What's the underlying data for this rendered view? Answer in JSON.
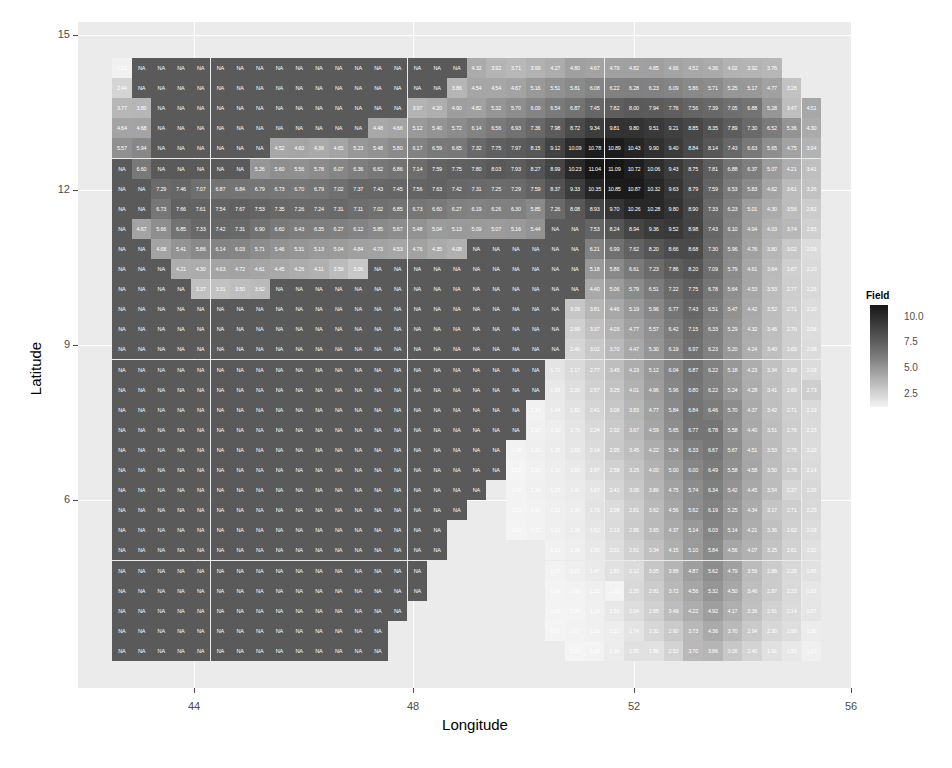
{
  "chart_data": {
    "type": "heatmap",
    "title": "",
    "xlabel": "Longitude",
    "ylabel": "Latitude",
    "x_ticks": [
      "44",
      "48",
      "52",
      "56"
    ],
    "y_ticks": [
      "15",
      "12",
      "9",
      "6"
    ],
    "xlim": [
      42.2,
      56.2
    ],
    "ylim": [
      3.6,
      15.4
    ],
    "legend": {
      "title": "Field",
      "ticks": [
        "10.0",
        "7.5",
        "5.0",
        "2.5"
      ],
      "range": [
        1.0,
        11.1
      ],
      "low_color": "#f4f4f4",
      "high_color": "#161616"
    },
    "na_color": "#5a5a5a",
    "n_cols": 36,
    "n_rows": 30,
    "rows": [
      [
        "1.12",
        "NA",
        "NA",
        "NA",
        "NA",
        "NA",
        "NA",
        "NA",
        "NA",
        "NA",
        "NA",
        "NA",
        "NA",
        "NA",
        "NA",
        "NA",
        "NA",
        "NA",
        "4.32",
        "3.92",
        "3.71",
        "3.99",
        "4.27",
        "4.80",
        "4.67",
        "4.79",
        "4.82",
        "4.85",
        "4.66",
        "4.52",
        "4.36",
        "4.02",
        "3.92",
        "3.76",
        "",
        ""
      ],
      [
        "2.44",
        "NA",
        "NA",
        "NA",
        "NA",
        "NA",
        "NA",
        "NA",
        "NA",
        "NA",
        "NA",
        "NA",
        "NA",
        "NA",
        "NA",
        "NA",
        "NA",
        "3.86",
        "4.54",
        "4.54",
        "4.67",
        "5.16",
        "5.51",
        "5.81",
        "6.08",
        "6.22",
        "6.28",
        "6.23",
        "6.09",
        "5.86",
        "5.71",
        "5.25",
        "5.17",
        "4.77",
        "3.28",
        ""
      ],
      [
        "3.77",
        "3.80",
        "NA",
        "NA",
        "NA",
        "NA",
        "NA",
        "NA",
        "NA",
        "NA",
        "NA",
        "NA",
        "NA",
        "NA",
        "NA",
        "3.97",
        "4.20",
        "4.90",
        "4.82",
        "5.32",
        "5.70",
        "6.09",
        "6.54",
        "6.87",
        "7.45",
        "7.82",
        "8.00",
        "7.94",
        "7.76",
        "7.56",
        "7.39",
        "7.05",
        "6.88",
        "5.28",
        "3.47",
        "4.51"
      ],
      [
        "4.64",
        "4.68",
        "NA",
        "NA",
        "NA",
        "NA",
        "NA",
        "NA",
        "NA",
        "NA",
        "NA",
        "NA",
        "NA",
        "4.48",
        "4.66",
        "5.12",
        "5.40",
        "5.72",
        "6.14",
        "6.56",
        "6.93",
        "7.36",
        "7.98",
        "8.72",
        "9.34",
        "9.81",
        "9.80",
        "9.51",
        "9.21",
        "8.85",
        "8.35",
        "7.89",
        "7.30",
        "6.52",
        "5.36",
        "4.30"
      ],
      [
        "5.57",
        "5.94",
        "NA",
        "NA",
        "NA",
        "NA",
        "NA",
        "NA",
        "4.52",
        "4.60",
        "4.36",
        "4.65",
        "5.23",
        "5.48",
        "5.80",
        "6.17",
        "6.59",
        "6.65",
        "7.32",
        "7.75",
        "7.97",
        "8.15",
        "9.12",
        "10.09",
        "10.78",
        "10.89",
        "10.43",
        "9.90",
        "9.40",
        "8.84",
        "8.14",
        "7.43",
        "6.63",
        "5.65",
        "4.75",
        "3.94"
      ],
      [
        "NA",
        "6.60",
        "NA",
        "NA",
        "NA",
        "NA",
        "NA",
        "5.26",
        "5.60",
        "5.56",
        "5.78",
        "6.07",
        "6.36",
        "6.62",
        "6.86",
        "7.14",
        "7.59",
        "7.75",
        "7.80",
        "8.03",
        "7.93",
        "8.27",
        "8.99",
        "10.23",
        "11.04",
        "11.09",
        "10.72",
        "10.06",
        "9.43",
        "8.75",
        "7.81",
        "6.88",
        "6.37",
        "5.07",
        "4.21",
        "3.41"
      ],
      [
        "NA",
        "NA",
        "7.29",
        "7.46",
        "7.07",
        "6.87",
        "6.84",
        "6.79",
        "6.73",
        "6.70",
        "6.79",
        "7.02",
        "7.37",
        "7.43",
        "7.45",
        "7.56",
        "7.63",
        "7.42",
        "7.31",
        "7.25",
        "7.29",
        "7.59",
        "8.37",
        "9.33",
        "10.35",
        "10.85",
        "10.87",
        "10.32",
        "9.63",
        "8.79",
        "7.59",
        "6.53",
        "5.83",
        "4.62",
        "3.61",
        "3.26"
      ],
      [
        "NA",
        "NA",
        "6.73",
        "7.66",
        "7.61",
        "7.54",
        "7.67",
        "7.53",
        "7.35",
        "7.26",
        "7.24",
        "7.31",
        "7.11",
        "7.02",
        "6.85",
        "6.73",
        "6.60",
        "6.27",
        "6.19",
        "6.26",
        "6.30",
        "5.85",
        "7.26",
        "8.08",
        "8.93",
        "9.70",
        "10.26",
        "10.28",
        "9.80",
        "8.90",
        "7.33",
        "6.23",
        "5.01",
        "4.30",
        "3.56",
        "2.82"
      ],
      [
        "NA",
        "4.67",
        "5.66",
        "6.85",
        "7.33",
        "7.42",
        "7.31",
        "6.90",
        "6.60",
        "6.43",
        "6.35",
        "6.27",
        "6.12",
        "5.85",
        "5.67",
        "5.48",
        "5.04",
        "5.13",
        "5.09",
        "5.07",
        "5.16",
        "5.44",
        "NA",
        "NA",
        "7.53",
        "8.24",
        "8.94",
        "9.36",
        "9.52",
        "8.98",
        "7.43",
        "6.10",
        "4.94",
        "4.03",
        "3.74",
        "2.65"
      ],
      [
        "NA",
        "NA",
        "4.68",
        "5.41",
        "5.86",
        "6.14",
        "6.03",
        "5.71",
        "5.46",
        "5.31",
        "5.13",
        "5.04",
        "4.84",
        "4.73",
        "4.53",
        "4.76",
        "4.35",
        "4.08",
        "NA",
        "NA",
        "NA",
        "NA",
        "NA",
        "NA",
        "6.21",
        "6.99",
        "7.62",
        "8.20",
        "8.66",
        "8.68",
        "7.30",
        "5.96",
        "4.76",
        "3.80",
        "3.02",
        "2.09"
      ],
      [
        "NA",
        "NA",
        "NA",
        "4.21",
        "4.30",
        "4.63",
        "4.72",
        "4.61",
        "4.45",
        "4.26",
        "4.11",
        "3.59",
        "3.06",
        "NA",
        "NA",
        "NA",
        "NA",
        "NA",
        "NA",
        "NA",
        "NA",
        "NA",
        "NA",
        "NA",
        "5.18",
        "5.86",
        "6.61",
        "7.23",
        "7.86",
        "8.20",
        "7.09",
        "5.79",
        "4.61",
        "3.64",
        "2.67",
        "2.20"
      ],
      [
        "NA",
        "NA",
        "NA",
        "NA",
        "3.37",
        "3.31",
        "3.50",
        "3.62",
        "NA",
        "NA",
        "NA",
        "NA",
        "NA",
        "NA",
        "NA",
        "NA",
        "NA",
        "NA",
        "NA",
        "NA",
        "NA",
        "NA",
        "NA",
        "NA",
        "4.40",
        "5.06",
        "5.79",
        "6.51",
        "7.22",
        "7.75",
        "6.78",
        "5.64",
        "4.53",
        "3.53",
        "2.77",
        "2.25"
      ],
      [
        "NA",
        "NA",
        "NA",
        "NA",
        "NA",
        "NA",
        "NA",
        "NA",
        "NA",
        "NA",
        "NA",
        "NA",
        "NA",
        "NA",
        "NA",
        "NA",
        "NA",
        "NA",
        "NA",
        "NA",
        "NA",
        "NA",
        "NA",
        "3.09",
        "3.81",
        "4.46",
        "5.19",
        "5.96",
        "6.77",
        "7.43",
        "6.51",
        "5.47",
        "4.42",
        "3.52",
        "2.71",
        "2.10"
      ],
      [
        "NA",
        "NA",
        "NA",
        "NA",
        "NA",
        "NA",
        "NA",
        "NA",
        "NA",
        "NA",
        "NA",
        "NA",
        "NA",
        "NA",
        "NA",
        "NA",
        "NA",
        "NA",
        "NA",
        "NA",
        "NA",
        "NA",
        "NA",
        "2.69",
        "3.37",
        "4.03",
        "4.77",
        "5.57",
        "6.42",
        "7.15",
        "6.33",
        "5.29",
        "4.32",
        "3.46",
        "2.70",
        "2.06"
      ],
      [
        "NA",
        "NA",
        "NA",
        "NA",
        "NA",
        "NA",
        "NA",
        "NA",
        "NA",
        "NA",
        "NA",
        "NA",
        "NA",
        "NA",
        "NA",
        "NA",
        "NA",
        "NA",
        "NA",
        "NA",
        "NA",
        "NA",
        "NA",
        "2.40",
        "3.02",
        "3.70",
        "4.47",
        "5.30",
        "6.19",
        "6.97",
        "6.23",
        "5.20",
        "4.24",
        "3.40",
        "2.69",
        "2.08"
      ],
      [
        "NA",
        "NA",
        "NA",
        "NA",
        "NA",
        "NA",
        "NA",
        "NA",
        "NA",
        "NA",
        "NA",
        "NA",
        "NA",
        "NA",
        "NA",
        "NA",
        "NA",
        "NA",
        "NA",
        "NA",
        "NA",
        "NA",
        "1.71",
        "2.17",
        "2.77",
        "3.45",
        "4.23",
        "5.12",
        "6.04",
        "6.87",
        "6.22",
        "5.18",
        "4.23",
        "3.34",
        "2.69",
        "2.09"
      ],
      [
        "NA",
        "NA",
        "NA",
        "NA",
        "NA",
        "NA",
        "NA",
        "NA",
        "NA",
        "NA",
        "NA",
        "NA",
        "NA",
        "NA",
        "NA",
        "NA",
        "NA",
        "NA",
        "NA",
        "NA",
        "NA",
        "NA",
        "1.56",
        "2.00",
        "2.57",
        "3.25",
        "4.01",
        "4.96",
        "5.96",
        "6.80",
        "6.22",
        "5.24",
        "4.28",
        "3.41",
        "2.69",
        "2.73"
      ],
      [
        "NA",
        "NA",
        "NA",
        "NA",
        "NA",
        "NA",
        "NA",
        "NA",
        "NA",
        "NA",
        "NA",
        "NA",
        "NA",
        "NA",
        "NA",
        "NA",
        "NA",
        "NA",
        "NA",
        "NA",
        "NA",
        "1.14",
        "1.44",
        "1.82",
        "2.41",
        "3.06",
        "3.83",
        "4.77",
        "5.84",
        "6.84",
        "6.46",
        "5.70",
        "4.37",
        "3.42",
        "2.71",
        "2.19"
      ],
      [
        "NA",
        "NA",
        "NA",
        "NA",
        "NA",
        "NA",
        "NA",
        "NA",
        "NA",
        "NA",
        "NA",
        "NA",
        "NA",
        "NA",
        "NA",
        "NA",
        "NA",
        "NA",
        "NA",
        "NA",
        "NA",
        "1.17",
        "1.32",
        "1.70",
        "2.24",
        "2.92",
        "3.67",
        "4.59",
        "5.65",
        "6.77",
        "6.78",
        "5.58",
        "4.40",
        "3.51",
        "2.76",
        "2.15"
      ],
      [
        "NA",
        "NA",
        "NA",
        "NA",
        "NA",
        "NA",
        "NA",
        "NA",
        "NA",
        "NA",
        "NA",
        "NA",
        "NA",
        "NA",
        "NA",
        "NA",
        "NA",
        "NA",
        "NA",
        "NA",
        "1.08",
        "1.21",
        "1.36",
        "1.63",
        "2.14",
        "2.95",
        "3.45",
        "4.22",
        "5.34",
        "6.33",
        "6.67",
        "5.67",
        "4.51",
        "3.53",
        "2.75",
        "2.10"
      ],
      [
        "NA",
        "NA",
        "NA",
        "NA",
        "NA",
        "NA",
        "NA",
        "NA",
        "NA",
        "NA",
        "NA",
        "NA",
        "NA",
        "NA",
        "NA",
        "NA",
        "NA",
        "NA",
        "NA",
        "NA",
        "1.01",
        "1.15",
        "1.30",
        "1.50",
        "1.97",
        "2.58",
        "3.25",
        "4.00",
        "5.00",
        "6.00",
        "6.49",
        "5.58",
        "4.58",
        "3.50",
        "2.78",
        "2.14"
      ],
      [
        "NA",
        "NA",
        "NA",
        "NA",
        "NA",
        "NA",
        "NA",
        "NA",
        "NA",
        "NA",
        "NA",
        "NA",
        "NA",
        "NA",
        "NA",
        "NA",
        "NA",
        "NA",
        "NA",
        "",
        "1.06",
        "1.16",
        "1.26",
        "1.41",
        "1.67",
        "2.42",
        "3.06",
        "3.86",
        "4.75",
        "5.74",
        "6.34",
        "5.42",
        "4.45",
        "3.54",
        "2.37",
        "2.26"
      ],
      [
        "NA",
        "NA",
        "NA",
        "NA",
        "NA",
        "NA",
        "NA",
        "NA",
        "NA",
        "NA",
        "NA",
        "NA",
        "NA",
        "NA",
        "NA",
        "NA",
        "NA",
        "NA",
        "",
        "",
        "1.03",
        "1.10",
        "1.21",
        "1.34",
        "1.76",
        "2.08",
        "2.81",
        "3.62",
        "4.56",
        "5.62",
        "6.19",
        "5.25",
        "4.34",
        "3.17",
        "2.71",
        "2.25"
      ],
      [
        "NA",
        "NA",
        "NA",
        "NA",
        "NA",
        "NA",
        "NA",
        "NA",
        "NA",
        "NA",
        "NA",
        "NA",
        "NA",
        "NA",
        "NA",
        "NA",
        "NA",
        "",
        "",
        "",
        "1.02",
        "1.11",
        "1.21",
        "1.36",
        "1.62",
        "2.13",
        "2.86",
        "3.65",
        "4.37",
        "5.14",
        "6.03",
        "5.14",
        "4.21",
        "3.36",
        "2.62",
        "2.09"
      ],
      [
        "NA",
        "NA",
        "NA",
        "NA",
        "NA",
        "NA",
        "NA",
        "NA",
        "NA",
        "NA",
        "NA",
        "NA",
        "NA",
        "NA",
        "NA",
        "NA",
        "NA",
        "",
        "",
        "",
        "",
        "",
        "1.13",
        "1.26",
        "1.56",
        "2.01",
        "2.61",
        "3.34",
        "4.15",
        "5.10",
        "5.84",
        "4.56",
        "4.07",
        "3.25",
        "2.61",
        "1.92"
      ],
      [
        "NA",
        "NA",
        "NA",
        "NA",
        "NA",
        "NA",
        "NA",
        "NA",
        "NA",
        "NA",
        "NA",
        "NA",
        "NA",
        "NA",
        "NA",
        "NA",
        "",
        "",
        "",
        "",
        "",
        "",
        "1.07",
        "1.21",
        "1.47",
        "1.85",
        "2.12",
        "3.05",
        "3.88",
        "4.87",
        "5.62",
        "4.79",
        "3.59",
        "2.88",
        "2.28",
        "1.86"
      ],
      [
        "NA",
        "NA",
        "NA",
        "NA",
        "NA",
        "NA",
        "NA",
        "NA",
        "NA",
        "NA",
        "NA",
        "NA",
        "NA",
        "NA",
        "NA",
        "NA",
        "",
        "",
        "",
        "",
        "",
        "",
        "1.04",
        "1.09",
        "1.21",
        "1.05",
        "2.25",
        "2.81",
        "3.72",
        "4.56",
        "5.32",
        "4.50",
        "3.46",
        "2.87",
        "2.23",
        "1.62"
      ],
      [
        "NA",
        "NA",
        "NA",
        "NA",
        "NA",
        "NA",
        "NA",
        "NA",
        "NA",
        "NA",
        "NA",
        "NA",
        "NA",
        "NA",
        "NA",
        "",
        "",
        "",
        "",
        "",
        "",
        "",
        "1.03",
        "1.06",
        "1.16",
        "1.56",
        "2.04",
        "2.65",
        "3.49",
        "4.22",
        "4.92",
        "4.17",
        "3.36",
        "2.61",
        "2.14",
        "1.67"
      ],
      [
        "NA",
        "NA",
        "NA",
        "NA",
        "NA",
        "NA",
        "NA",
        "NA",
        "NA",
        "NA",
        "NA",
        "NA",
        "NA",
        "NA",
        "",
        "",
        "",
        "",
        "",
        "",
        "",
        "",
        "1.02",
        "1.07",
        "1.16",
        "1.32",
        "1.74",
        "2.31",
        "2.90",
        "3.73",
        "4.36",
        "3.70",
        "2.94",
        "2.30",
        "1.99",
        "1.36"
      ],
      [
        "NA",
        "NA",
        "NA",
        "NA",
        "NA",
        "NA",
        "NA",
        "NA",
        "NA",
        "NA",
        "NA",
        "NA",
        "NA",
        "NA",
        "",
        "",
        "",
        "",
        "",
        "",
        "",
        "",
        "",
        "1.01",
        "1.06",
        "1.36",
        "1.85",
        "1.86",
        "2.52",
        "3.70",
        "3.86",
        "3.06",
        "2.46",
        "1.91",
        "1.55",
        "1.17"
      ]
    ]
  },
  "axes": {
    "x_label": "Longitude",
    "y_label": "Latitude",
    "x_ticks": [
      "44",
      "48",
      "52",
      "56"
    ],
    "y_ticks": [
      "15",
      "12",
      "9",
      "6"
    ]
  },
  "legend": {
    "title": "Field",
    "ticks": [
      "10.0",
      "7.5",
      "5.0",
      "2.5"
    ]
  }
}
